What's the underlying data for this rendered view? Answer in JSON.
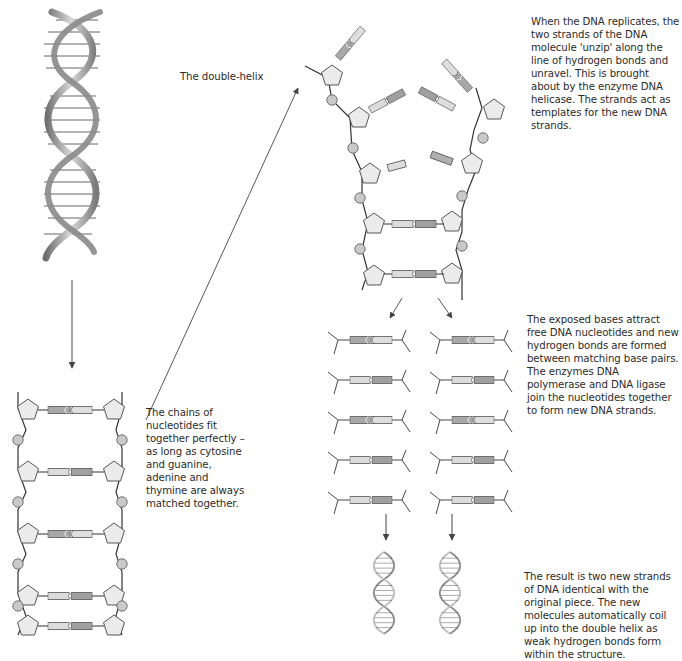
{
  "figure": {
    "title_label": "The double-helix",
    "captions": {
      "unzip": "When the DNA replicates, the two strands of the DNA molecule 'unzip' along the line of hydrogen bonds and unravel. This is brought about by the enzyme DNA helicase. The strands act as templates for the new DNA strands.",
      "pairing": "The chains of nucleotides fit together perfectly – as long as cytosine and guanine, adenine and thymine are always matched together.",
      "synthesis": "The exposed bases attract free DNA nucleotides and new hydrogen bonds are formed between matching base pairs. The enzymes DNA polymerase and DNA ligase join the nucleotides together to form new DNA strands.",
      "result": "The result is two new strands of DNA identical with the original piece. The new molecules automatically coil up into the double helix as weak hydrogen bonds form within the structure."
    },
    "ladder_pairs": [
      {
        "left": "G",
        "right": "C"
      },
      {
        "left": "A",
        "right": "T"
      },
      {
        "left": "C",
        "right": "G"
      },
      {
        "left": "T",
        "right": "A"
      },
      {
        "left": "A",
        "right": "T"
      }
    ],
    "unzip_pairs_joined": [
      {
        "left": "T",
        "right": "A"
      },
      {
        "left": "A",
        "right": "T"
      }
    ],
    "new_strand_rows": [
      {
        "left": "G",
        "right": "C"
      },
      {
        "left": "A",
        "right": "T"
      },
      {
        "left": "C",
        "right": "G"
      },
      {
        "left": "T",
        "right": "A"
      },
      {
        "left": "A",
        "right": "T"
      }
    ],
    "colors": {
      "line": "#333333",
      "sugar_fill": "#e8e8e8",
      "phosphate_fill": "#c8c8c8",
      "base_dark": "#9a9a9a",
      "base_light": "#dcdcdc",
      "helix_ribbon": "#9d9d9d"
    }
  }
}
